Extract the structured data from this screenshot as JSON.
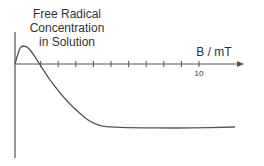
{
  "chart_data": {
    "type": "line",
    "title": "",
    "ylabel_lines": [
      "Free Radical",
      "Concentration",
      "in Solution"
    ],
    "xlabel": "B / mT",
    "x_tick_values": [
      1,
      2,
      3,
      4,
      5,
      6,
      7,
      8,
      9,
      10
    ],
    "x_tick_labels": [
      {
        "value": 10,
        "label": "10"
      }
    ],
    "xlim": [
      0,
      13
    ],
    "ylim_note": "qualitative, no y ticks",
    "series": [
      {
        "name": "Free Radical Concentration",
        "x": [
          0,
          0.15,
          0.3,
          0.5,
          0.8,
          1.2,
          2,
          3,
          4,
          4.5,
          5,
          6,
          8,
          10,
          12.5
        ],
        "y": [
          0,
          0.5,
          0.9,
          1.0,
          0.85,
          0.3,
          -0.9,
          -2.1,
          -3.0,
          -3.3,
          -3.45,
          -3.52,
          -3.55,
          -3.55,
          -3.5
        ]
      }
    ],
    "grid": false,
    "colors": {
      "line": "#555555",
      "axis": "#555555"
    }
  }
}
